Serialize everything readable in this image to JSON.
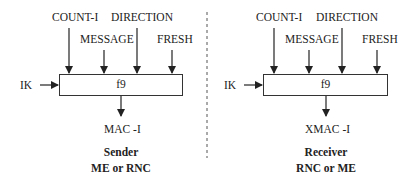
{
  "sender": {
    "inputs": [
      "COUNT-I",
      "MESSAGE",
      "DIRECTION",
      "FRESH"
    ],
    "key": "IK",
    "function": "f9",
    "output": "MAC -I",
    "role": "Sender",
    "entity": "ME or RNC"
  },
  "receiver": {
    "inputs": [
      "COUNT-I",
      "MESSAGE",
      "DIRECTION",
      "FRESH"
    ],
    "key": "IK",
    "function": "f9",
    "output": "XMAC -I",
    "role": "Receiver",
    "entity": "RNC or ME"
  },
  "colors": {
    "line": "#222222",
    "divider": "#555555"
  }
}
